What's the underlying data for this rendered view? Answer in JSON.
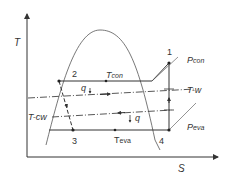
{
  "diagram": {
    "type": "T-S refrigeration cycle diagram",
    "axes": {
      "y_label": "T",
      "x_label": "S"
    },
    "points": [
      {
        "id": "1",
        "label": "1"
      },
      {
        "id": "2",
        "label": "2"
      },
      {
        "id": "3",
        "label": "3"
      },
      {
        "id": "4",
        "label": "4"
      }
    ],
    "lines": {
      "condensing_temp": "T",
      "condensing_temp_sub": "con",
      "evaporating_temp": "T",
      "evaporating_temp_sub": "eva",
      "warm_water": "T-w",
      "cooling_water": "T-cw",
      "pressure_con": "P",
      "pressure_con_sub": "con",
      "pressure_eva": "P",
      "pressure_eva_sub": "eva"
    },
    "heat_labels": {
      "q_top": "q",
      "q_bottom": "q"
    },
    "colors": {
      "line": "#333333",
      "curve": "#555555"
    }
  }
}
